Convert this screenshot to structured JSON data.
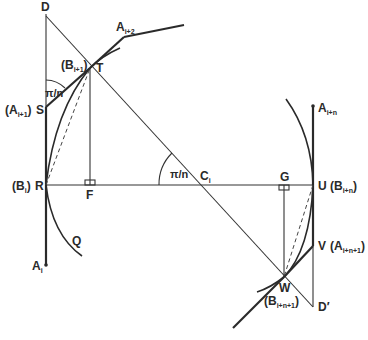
{
  "diagram": {
    "type": "geometric construction",
    "angle_label": "π/n",
    "points": {
      "D": {
        "label": "D",
        "x": 46,
        "y": 12
      },
      "A_i2": {
        "label": "A",
        "sub": "i+2",
        "x": 124,
        "y": 37
      },
      "T": {
        "label": "T",
        "alt": "(B",
        "alt_sub": "i+1",
        "x": 90,
        "y": 68
      },
      "S": {
        "label": "S",
        "alt": "(A",
        "alt_sub": "i+1",
        "x": 46,
        "y": 107
      },
      "R": {
        "label": "R",
        "alt": "(B",
        "alt_sub": "i",
        "x": 46,
        "y": 185
      },
      "F": {
        "label": "F",
        "x": 90,
        "y": 185
      },
      "C_i": {
        "label": "C",
        "sub": "i",
        "x": 203,
        "y": 185
      },
      "G": {
        "label": "G",
        "x": 284,
        "y": 185
      },
      "U": {
        "label": "U",
        "alt": "(B",
        "alt_sub": "i+n",
        "x": 313,
        "y": 185
      },
      "A_in": {
        "label": "A",
        "sub": "i+n",
        "x": 313,
        "y": 106
      },
      "V": {
        "label": "V",
        "alt": "(A",
        "alt_sub": "i+n+1",
        "x": 313,
        "y": 246
      },
      "W": {
        "label": "W",
        "alt": "(B",
        "alt_sub": "i+n+1",
        "x": 284,
        "y": 277
      },
      "D_prime": {
        "label": "D′",
        "x": 313,
        "y": 307
      },
      "Q": {
        "label": "Q"
      },
      "A_i": {
        "label": "A",
        "sub": "i",
        "x": 46,
        "y": 265
      }
    },
    "paren_close": ")"
  }
}
